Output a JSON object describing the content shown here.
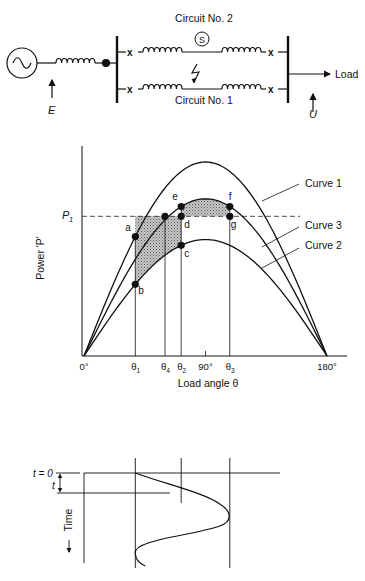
{
  "circuit": {
    "circuit2_label": "Circuit No. 2",
    "circuit1_label": "Circuit No. 1",
    "switch_symbol": "S",
    "load_label": "Load",
    "e_label": "E",
    "u_label": "U",
    "source_icon": "ac-source-icon",
    "fault_icon": "lightning-fault-icon"
  },
  "chart_data": {
    "type": "line",
    "title": "",
    "xlabel": "Load angle θ",
    "ylabel": "Power 'P'",
    "xlim": [
      0,
      180
    ],
    "ylim": [
      0,
      1.15
    ],
    "x_ticks": [
      {
        "label": "0°",
        "value": 0
      },
      {
        "label": "θ",
        "sub": "1",
        "value": 38
      },
      {
        "label": "θ",
        "sub": "4",
        "value": 60
      },
      {
        "label": "θ",
        "sub": "2",
        "value": 72
      },
      {
        "label": "90°",
        "value": 90
      },
      {
        "label": "θ",
        "sub": "3",
        "value": 108
      },
      {
        "label": "180°",
        "value": 180
      }
    ],
    "p1": {
      "label": "P",
      "sub": "1",
      "value": 0.72
    },
    "series": [
      {
        "name": "Curve 1",
        "amplitude": 1.0
      },
      {
        "name": "Curve 3",
        "amplitude": 0.81
      },
      {
        "name": "Curve 2",
        "amplitude": 0.6
      }
    ],
    "points": [
      {
        "label": "a",
        "theta": 38,
        "curve": "Curve 1"
      },
      {
        "label": "b",
        "theta": 38,
        "curve": "Curve 2"
      },
      {
        "label": "e",
        "theta": 72,
        "curve": "Curve 3"
      },
      {
        "label": "d",
        "theta": 72,
        "curve": "P1"
      },
      {
        "label": "c",
        "theta": 72,
        "curve": "Curve 2"
      },
      {
        "label": "f",
        "theta": 108,
        "curve": "Curve 3"
      },
      {
        "label": "g",
        "theta": 108,
        "curve": "P1"
      },
      {
        "label": "",
        "theta": 60,
        "curve": "P1"
      }
    ],
    "shaded_regions": [
      "accelerating area a-b-c-d",
      "decelerating area d-e-f-g"
    ]
  },
  "time_plot": {
    "t0_label": "t = 0",
    "t_label": "t",
    "time_label": "Time",
    "swing": {
      "start_theta": 38,
      "max_theta": 108,
      "min_theta": 38
    }
  }
}
